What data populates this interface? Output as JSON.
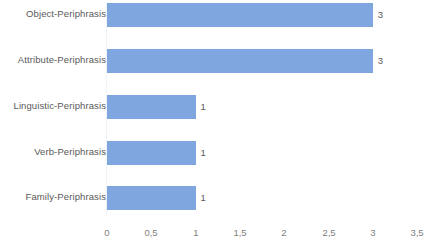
{
  "chart_data": {
    "type": "bar",
    "orientation": "horizontal",
    "title": "",
    "xlabel": "",
    "ylabel": "",
    "categories": [
      "Object-Periphrasis",
      "Attribute-Periphrasis",
      "Linguistic-Periphrasis",
      "Verb-Periphrasis",
      "Family-Periphrasis"
    ],
    "values": [
      3,
      3,
      1,
      1,
      1
    ],
    "data_labels": [
      "3",
      "3",
      "1",
      "1",
      "1"
    ],
    "xlim": [
      0,
      3.5
    ],
    "xticks": [
      0,
      0.5,
      1,
      1.5,
      2,
      2.5,
      3,
      3.5
    ],
    "xtick_labels": [
      "0",
      "0,5",
      "1",
      "1,5",
      "2",
      "2,5",
      "3",
      "3,5"
    ],
    "grid": false,
    "legend": false,
    "bar_color": "#7fa6de",
    "label_color": "#595959",
    "tick_color": "#808080",
    "background_color": "#ffffff"
  }
}
